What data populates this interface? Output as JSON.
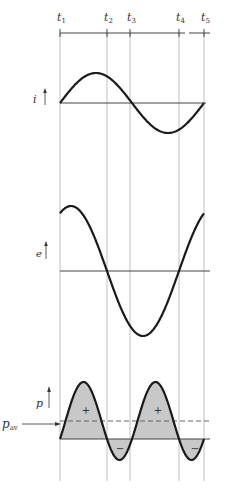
{
  "figure": {
    "time_markers": [
      {
        "label": "t",
        "sub": "1",
        "x": 60
      },
      {
        "label": "t",
        "sub": "2",
        "x": 107
      },
      {
        "label": "t",
        "sub": "3",
        "x": 130
      },
      {
        "label": "t",
        "sub": "4",
        "x": 179
      },
      {
        "label": "t",
        "sub": "5",
        "x": 204
      }
    ],
    "plots": {
      "current": {
        "label": "i",
        "axis_y": 103,
        "amplitude_px": 30
      },
      "voltage": {
        "label": "e",
        "axis_y": 271,
        "amplitude_px": 65,
        "phase_deg": 27.5
      },
      "power": {
        "label": "p",
        "avg_label": "p",
        "avg_sub": "av",
        "axis_y": 439,
        "scale_px": 78,
        "positive_sign": "+",
        "negative_sign": "−"
      }
    },
    "colors": {
      "curve": "#1a1a1a",
      "grid": "#b0b0b0",
      "fill": "#c8c8c8",
      "axis": "#444444"
    }
  }
}
